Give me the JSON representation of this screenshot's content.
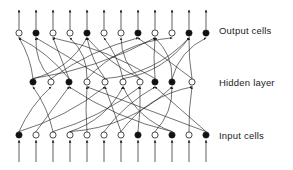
{
  "diagram": {
    "stroke_color": "#1b1b1b",
    "node_fill_open": "#ffffff",
    "node_fill_closed": "#111111",
    "background": "#ffffff",
    "node_radius": 3.1,
    "labels": {
      "output": "Output cells",
      "hidden": "Hidden layer",
      "input": "Input cells"
    },
    "layers": [
      {
        "name": "output",
        "y": 33,
        "count": 12,
        "nodes": [
          {
            "x": 19,
            "filled": false
          },
          {
            "x": 36,
            "filled": true
          },
          {
            "x": 53,
            "filled": false
          },
          {
            "x": 70,
            "filled": false
          },
          {
            "x": 87,
            "filled": true
          },
          {
            "x": 104,
            "filled": false
          },
          {
            "x": 121,
            "filled": false
          },
          {
            "x": 138,
            "filled": true
          },
          {
            "x": 155,
            "filled": false
          },
          {
            "x": 172,
            "filled": false
          },
          {
            "x": 189,
            "filled": true
          },
          {
            "x": 206,
            "filled": true
          }
        ]
      },
      {
        "name": "hidden",
        "y": 82,
        "count": 10,
        "nodes": [
          {
            "x": 33,
            "filled": true
          },
          {
            "x": 51,
            "filled": false
          },
          {
            "x": 69,
            "filled": true
          },
          {
            "x": 87,
            "filled": false
          },
          {
            "x": 105,
            "filled": false
          },
          {
            "x": 123,
            "filled": false
          },
          {
            "x": 140,
            "filled": false
          },
          {
            "x": 155,
            "filled": true
          },
          {
            "x": 172,
            "filled": true
          },
          {
            "x": 192,
            "filled": false
          }
        ]
      },
      {
        "name": "input",
        "y": 135,
        "count": 12,
        "nodes": [
          {
            "x": 19,
            "filled": true
          },
          {
            "x": 36,
            "filled": false
          },
          {
            "x": 53,
            "filled": false
          },
          {
            "x": 70,
            "filled": false
          },
          {
            "x": 87,
            "filled": false
          },
          {
            "x": 104,
            "filled": false
          },
          {
            "x": 121,
            "filled": false
          },
          {
            "x": 138,
            "filled": true
          },
          {
            "x": 155,
            "filled": false
          },
          {
            "x": 172,
            "filled": true
          },
          {
            "x": 189,
            "filled": false
          },
          {
            "x": 206,
            "filled": true
          }
        ]
      }
    ],
    "external_arrows": {
      "output_up_top": 10,
      "input_stem_bottom": 162
    },
    "edges_input_to_hidden": [
      {
        "from": 0,
        "to": 1
      },
      {
        "from": 1,
        "to": 2
      },
      {
        "from": 2,
        "to": 0
      },
      {
        "from": 3,
        "to": 5
      },
      {
        "from": 4,
        "to": 3
      },
      {
        "from": 5,
        "to": 7
      },
      {
        "from": 6,
        "to": 4
      },
      {
        "from": 7,
        "to": 6
      },
      {
        "from": 8,
        "to": 8
      },
      {
        "from": 9,
        "to": 5
      },
      {
        "from": 10,
        "to": 9
      },
      {
        "from": 11,
        "to": 7
      },
      {
        "from": 0,
        "to": 4
      },
      {
        "from": 3,
        "to": 8
      },
      {
        "from": 6,
        "to": 9
      },
      {
        "from": 9,
        "to": 2
      },
      {
        "from": 11,
        "to": 3
      },
      {
        "from": 2,
        "to": 6
      }
    ],
    "edges_hidden_to_output": [
      {
        "from": 0,
        "to": 0
      },
      {
        "from": 0,
        "to": 4
      },
      {
        "from": 1,
        "to": 1
      },
      {
        "from": 1,
        "to": 7
      },
      {
        "from": 2,
        "to": 2
      },
      {
        "from": 2,
        "to": 0
      },
      {
        "from": 3,
        "to": 3
      },
      {
        "from": 3,
        "to": 9
      },
      {
        "from": 4,
        "to": 4
      },
      {
        "from": 4,
        "to": 1
      },
      {
        "from": 5,
        "to": 5
      },
      {
        "from": 5,
        "to": 10
      },
      {
        "from": 6,
        "to": 6
      },
      {
        "from": 6,
        "to": 4
      },
      {
        "from": 7,
        "to": 8
      },
      {
        "from": 7,
        "to": 2
      },
      {
        "from": 8,
        "to": 8
      },
      {
        "from": 8,
        "to": 11
      },
      {
        "from": 9,
        "to": 10
      },
      {
        "from": 9,
        "to": 7
      },
      {
        "from": 0,
        "to": 8
      },
      {
        "from": 4,
        "to": 10
      }
    ]
  }
}
